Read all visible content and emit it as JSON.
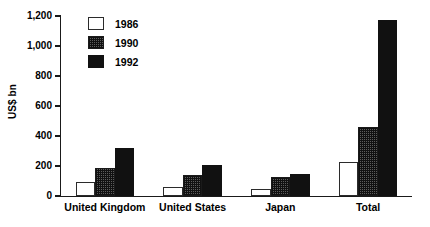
{
  "chart_data": {
    "type": "bar",
    "title": "",
    "subtitle": "",
    "xlabel": "",
    "ylabel": "US$ bn",
    "categories": [
      "United Kingdom",
      "United States",
      "Japan",
      "Total"
    ],
    "series": [
      {
        "name": "1986",
        "values": [
          95,
          60,
          50,
          225
        ],
        "fill": "white"
      },
      {
        "name": "1990",
        "values": [
          190,
          140,
          125,
          460
        ],
        "fill": "checker-gray"
      },
      {
        "name": "1992",
        "values": [
          320,
          205,
          145,
          1175
        ],
        "fill": "black"
      }
    ],
    "ylim": [
      0,
      1200
    ],
    "yticks": [
      0,
      200,
      400,
      600,
      800,
      1000,
      1200
    ],
    "ytick_labels": [
      "0",
      "200",
      "400",
      "600",
      "800",
      "1,000",
      "1,200"
    ],
    "grid": false,
    "legend_position": "top-left",
    "legend_entries": [
      "1986",
      "1990",
      "1992"
    ],
    "colors": {
      "series_1986": "#ffffff",
      "series_1990": "#5c5c5c",
      "series_1992": "#111111",
      "axis": "#1a1a1a",
      "text": "#000000",
      "background": "#ffffff"
    }
  }
}
